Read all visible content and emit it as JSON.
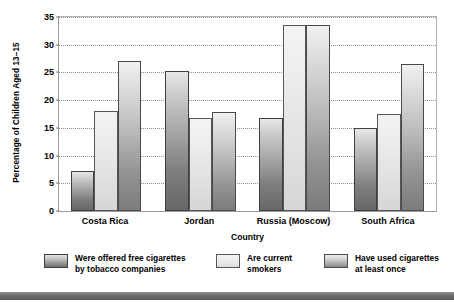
{
  "chart_data": {
    "type": "bar",
    "title": "",
    "xlabel": "Country",
    "ylabel": "Percentage of Children Aged 13–15",
    "categories": [
      "Costa Rica",
      "Jordan",
      "Russia (Moscow)",
      "South Africa"
    ],
    "series": [
      {
        "name": "Were offered free cigarettes\nby tobacco companies",
        "values": [
          7.2,
          25.2,
          16.8,
          15.0
        ]
      },
      {
        "name": "Are current\nsmokers",
        "values": [
          18.0,
          16.8,
          33.5,
          17.5
        ]
      },
      {
        "name": "Have used cigarettes\nat least once",
        "values": [
          27.0,
          17.8,
          33.5,
          26.5
        ]
      }
    ],
    "ylim": [
      0,
      35
    ],
    "yticks": [
      0,
      5,
      10,
      15,
      20,
      25,
      30,
      35
    ],
    "ytick_labels": [
      "0",
      "5",
      "10",
      "15",
      "20",
      "25",
      "30",
      "35"
    ],
    "grid": true,
    "grid_axis": "y",
    "legend_position": "bottom",
    "colors": {
      "series_1": "#8c8c8c",
      "series_2": "#e9e9e9",
      "series_3": "#b5b5b5",
      "axis": "#9a9a9a",
      "grid": "#8d8d8d",
      "text": "#000000",
      "bottom_rule": "#6e6e6e"
    }
  },
  "legend": {
    "items": [
      {
        "label": "Were offered free cigarettes\nby tobacco companies"
      },
      {
        "label": "Are current\nsmokers"
      },
      {
        "label": "Have used cigarettes\nat least once"
      }
    ]
  }
}
